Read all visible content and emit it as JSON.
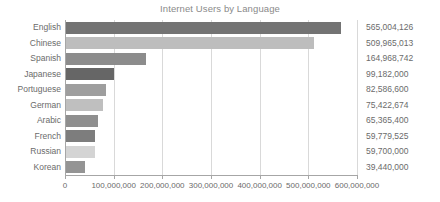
{
  "chart_data": {
    "type": "bar",
    "orientation": "horizontal",
    "title": "Internet Users by Language",
    "xlabel": "",
    "ylabel": "",
    "categories": [
      "English",
      "Chinese",
      "Spanish",
      "Japanese",
      "Portuguese",
      "German",
      "Arabic",
      "French",
      "Russian",
      "Korean"
    ],
    "values": [
      565004126,
      509965013,
      164968742,
      99182000,
      82586600,
      75422674,
      65365400,
      59779525,
      59700000,
      39440000
    ],
    "value_labels": [
      "565,004,126",
      "509,965,013",
      "164,968,742",
      "99,182,000",
      "82,586,600",
      "75,422,674",
      "65,365,400",
      "59,779,525",
      "59,700,000",
      "39,440,000"
    ],
    "bar_colors": [
      "#737373",
      "#bdbdbd",
      "#8c8c8c",
      "#666666",
      "#9e9e9e",
      "#bfbfbf",
      "#8f8f8f",
      "#7d7d7d",
      "#d4d4d4",
      "#949494"
    ],
    "xlim": [
      0,
      600000000
    ],
    "xticks": [
      0,
      100000000,
      200000000,
      300000000,
      400000000,
      500000000,
      600000000
    ],
    "xtick_labels": [
      "0",
      "100,000,000",
      "200,000,000",
      "300,000,000",
      "400,000,000",
      "500,000,000",
      "600,000,000"
    ],
    "grid": true,
    "grid_axis": "x",
    "legend": false,
    "value_labels_shown": true,
    "colors": {
      "grid": "#d9d9d9",
      "axis": "#a6a6a6",
      "title_text": "#8a8a8a",
      "label_text": "#6b6b6b",
      "background": "#ffffff"
    }
  }
}
